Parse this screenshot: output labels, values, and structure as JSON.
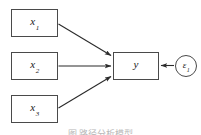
{
  "diagram": {
    "type": "path-diagram",
    "background_color": "#ffffff",
    "stroke_color": "#4a4a4a",
    "text_color": "#1a1a1a",
    "nodes": [
      {
        "id": "x1",
        "shape": "rectangle",
        "symbol": "x",
        "subscript": "1",
        "x": 11,
        "y": 9,
        "width": 47,
        "height": 28
      },
      {
        "id": "x2",
        "shape": "rectangle",
        "symbol": "x",
        "subscript": "2",
        "x": 11,
        "y": 52,
        "width": 47,
        "height": 28
      },
      {
        "id": "x3",
        "shape": "rectangle",
        "symbol": "x",
        "subscript": "3",
        "x": 11,
        "y": 95,
        "width": 47,
        "height": 28
      },
      {
        "id": "y",
        "shape": "rectangle",
        "symbol": "y",
        "subscript": "",
        "x": 113,
        "y": 52,
        "width": 46,
        "height": 28
      },
      {
        "id": "e1",
        "shape": "circle",
        "symbol": "ε",
        "subscript": "1",
        "x": 175,
        "y": 52,
        "width": 22,
        "height": 22
      }
    ],
    "edges": [
      {
        "id": "x1-to-y",
        "from": "x1",
        "to": "y",
        "style": "single-arrow",
        "direction": "forward"
      },
      {
        "id": "x2-to-y",
        "from": "x2",
        "to": "y",
        "style": "single-arrow",
        "direction": "forward"
      },
      {
        "id": "x3-to-y",
        "from": "x3",
        "to": "y",
        "style": "single-arrow",
        "direction": "forward"
      },
      {
        "id": "e1-to-y",
        "from": "e1",
        "to": "y",
        "style": "single-arrow",
        "direction": "forward"
      }
    ]
  },
  "caption": {
    "text": "图  路径分析模型"
  }
}
